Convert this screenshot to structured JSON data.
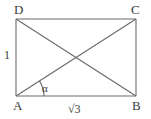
{
  "figure": {
    "type": "geometry-diagram",
    "shape": "rectangle-with-diagonals",
    "background_color": "#ffffff",
    "line_color": "#6b6b6b",
    "text_color": "#3a3a3a",
    "width": 151,
    "height": 119
  },
  "vertices": [
    {
      "id": "D",
      "label": "D",
      "x": 16,
      "y": 19
    },
    {
      "id": "C",
      "label": "C",
      "x": 136,
      "y": 19
    },
    {
      "id": "A",
      "label": "A",
      "x": 16,
      "y": 96
    },
    {
      "id": "B",
      "label": "B",
      "x": 136,
      "y": 96
    }
  ],
  "edges": [
    {
      "id": "DC",
      "from": "D",
      "to": "C",
      "kind": "side"
    },
    {
      "id": "CB",
      "from": "C",
      "to": "B",
      "kind": "side"
    },
    {
      "id": "BA",
      "from": "B",
      "to": "A",
      "kind": "side"
    },
    {
      "id": "AD",
      "from": "A",
      "to": "D",
      "kind": "side"
    },
    {
      "id": "AC",
      "from": "A",
      "to": "C",
      "kind": "diagonal"
    },
    {
      "id": "DB",
      "from": "D",
      "to": "B",
      "kind": "diagonal"
    }
  ],
  "measurements": {
    "height_label": "1",
    "base_label": "√3",
    "angle_label": "α"
  },
  "intersection": {
    "x": 76,
    "y": 57.5
  },
  "angle_arc": {
    "vertex": "A",
    "radius": 28,
    "start_deg": 0,
    "end_deg": 32.7
  }
}
